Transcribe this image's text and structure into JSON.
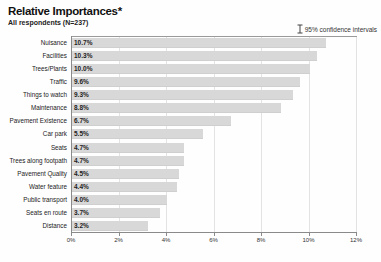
{
  "header": {
    "title": "Relative Importances*",
    "subtitle": "All respondents (N=237)",
    "legend_note": "95% confidence intervals"
  },
  "colors": {
    "bar": "#d8d8d8",
    "grid": "#e3e3e3",
    "axis": "#8a8a8a",
    "text": "#222222"
  },
  "chart_data": {
    "type": "bar",
    "orientation": "horizontal",
    "title": "Relative Importances*",
    "subtitle": "All respondents (N=237)",
    "legend_note": "95% confidence intervals",
    "categories": [
      "Nuisance",
      "Facilities",
      "Trees/Plants",
      "Traffic",
      "Things to watch",
      "Maintenance",
      "Pavement Existence",
      "Car park",
      "Seats",
      "Trees along footpath",
      "Pavement Quality",
      "Water feature",
      "Public transport",
      "Seats en route",
      "Distance"
    ],
    "values": [
      10.7,
      10.3,
      10.0,
      9.6,
      9.3,
      8.8,
      6.7,
      5.5,
      4.7,
      4.7,
      4.5,
      4.4,
      4.0,
      3.7,
      3.2
    ],
    "value_labels": [
      "10.7%",
      "10.3%",
      "10.0%",
      "9.6%",
      "9.3%",
      "8.8%",
      "6.7%",
      "5.5%",
      "4.7%",
      "4.7%",
      "4.5%",
      "4.4%",
      "4.0%",
      "3.7%",
      "3.2%"
    ],
    "xlabel": "",
    "ylabel": "",
    "xlim": [
      0,
      12
    ],
    "xtick_values": [
      0,
      2,
      4,
      6,
      8,
      10,
      12
    ],
    "xtick_labels": [
      "0%",
      "2%",
      "4%",
      "6%",
      "8%",
      "10%",
      "12%"
    ],
    "grid": true,
    "legend_position": "top-right"
  }
}
